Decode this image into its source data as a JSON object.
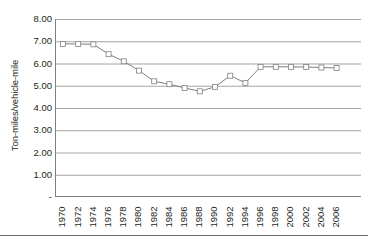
{
  "chart_data": {
    "type": "line",
    "title": "",
    "xlabel": "",
    "ylabel": "Ton-miles/vehicle-mile",
    "ylim": [
      0,
      8
    ],
    "xlim": [
      1970,
      2006
    ],
    "grid": true,
    "legend": null,
    "y_tick_labels": [
      "8.00",
      "7.00",
      "6.00",
      "5.00",
      "4.00",
      "3.00",
      "2.00",
      "1.00",
      "-"
    ],
    "y_tick_values": [
      8,
      7,
      6,
      5,
      4,
      3,
      2,
      1,
      0
    ],
    "x_tick_labels": [
      "1970",
      "1972",
      "1974",
      "1976",
      "1978",
      "1980",
      "1982",
      "1984",
      "1986",
      "1988",
      "1990",
      "1992",
      "1994",
      "1996",
      "1998",
      "2000",
      "2002",
      "2004",
      "2006"
    ],
    "x": [
      1970,
      1972,
      1974,
      1976,
      1978,
      1980,
      1982,
      1984,
      1986,
      1988,
      1990,
      1992,
      1994,
      1996,
      1998,
      2000,
      2002,
      2004,
      2006
    ],
    "values": [
      6.88,
      6.88,
      6.86,
      6.42,
      6.1,
      5.68,
      5.2,
      5.07,
      4.9,
      4.75,
      4.95,
      5.45,
      5.13,
      5.85,
      5.85,
      5.85,
      5.84,
      5.82,
      5.8
    ],
    "series_name": "Ton-miles per vehicle-mile",
    "line_color": "#808080",
    "marker": "open-square",
    "marker_fill": "#ffffff",
    "marker_edge": "#808080"
  },
  "colors": {
    "axis": "#808080",
    "grid": "#808080",
    "text": "#231f20",
    "footer_rule": "#6d6e71",
    "background": "#ffffff"
  }
}
